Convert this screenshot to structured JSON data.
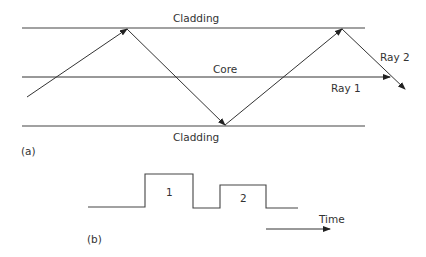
{
  "figure": {
    "panel_a": {
      "label": "(a)",
      "top_layer": "Cladding",
      "middle_layer": "Core",
      "bottom_layer": "Cladding",
      "ray1_label": "Ray 1",
      "ray2_label": "Ray 2"
    },
    "panel_b": {
      "label": "(b)",
      "pulse1_label": "1",
      "pulse2_label": "2",
      "time_label": "Time"
    },
    "colors": {
      "line": "#444444",
      "text": "#333333",
      "background": "#ffffff"
    }
  }
}
